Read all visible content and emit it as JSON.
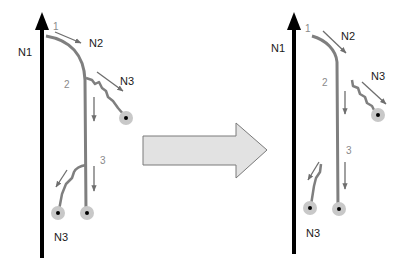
{
  "diagram": {
    "type": "before-after transformation",
    "colors": {
      "main_axis": "#000000",
      "path": "#7f7f7f",
      "motion_arrow": "#6e6e6e",
      "node_halo": "#c8c8c8",
      "node_center": "#000000",
      "transition_arrow_fill": "#e2e2e2",
      "transition_arrow_stroke": "#7a7a7a"
    },
    "left": {
      "axis_label": "N1",
      "labels": {
        "n2": "N2",
        "n3_upper": "N3",
        "n3_lower": "N3",
        "step1": "1",
        "step2": "2",
        "step3": "3"
      }
    },
    "right": {
      "axis_label": "N1",
      "labels": {
        "n2": "N2",
        "n3_upper": "N3",
        "n3_lower": "N3",
        "step1": "1",
        "step2": "2",
        "step3": "3"
      }
    }
  }
}
